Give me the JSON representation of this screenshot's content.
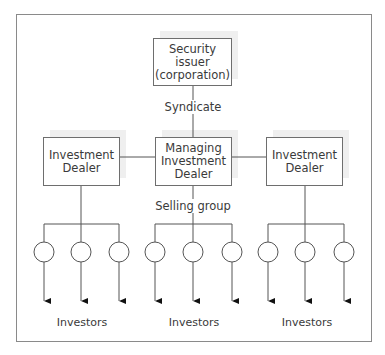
{
  "diagram": {
    "issuer": {
      "label": "Security\nissuer\n(corporation)"
    },
    "syndicate_label": "Syndicate",
    "managing_dealer": {
      "label": "Managing\nInvestment\nDealer"
    },
    "left_dealer": {
      "label": "Investment\nDealer"
    },
    "right_dealer": {
      "label": "Investment\nDealer"
    },
    "selling_group_label": "Selling group",
    "groups": [
      {
        "investors_label": "Investors",
        "members": 3
      },
      {
        "investors_label": "Investors",
        "members": 3
      },
      {
        "investors_label": "Investors",
        "members": 3
      }
    ],
    "colors": {
      "line": "#555555",
      "box_border": "#6e6e6e",
      "shadow": "#efefef",
      "frame": "#8a8a8a"
    }
  }
}
